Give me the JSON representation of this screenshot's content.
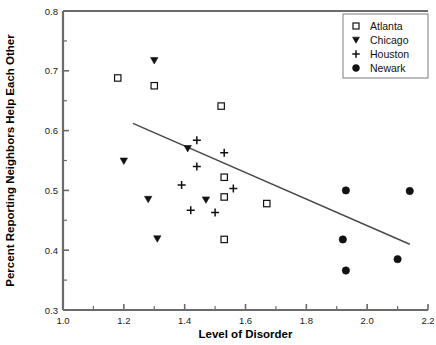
{
  "chart_data": {
    "type": "scatter",
    "title": "",
    "xlabel": "Level of Disorder",
    "ylabel": "Percent Reporting Neighbors Help Each Other",
    "xlim": [
      1.0,
      2.2
    ],
    "ylim": [
      0.3,
      0.8
    ],
    "xticks": [
      1.0,
      1.2,
      1.4,
      1.6,
      1.8,
      2.0,
      2.2
    ],
    "xtick_labels": [
      "1.0",
      "1.2",
      "1.4",
      "1.6",
      "1.8",
      "2.0",
      "2.2"
    ],
    "xtick_minor_step": 0.1,
    "yticks": [
      0.3,
      0.4,
      0.5,
      0.6,
      0.7,
      0.8
    ],
    "ytick_labels": [
      "0.3",
      "0.4",
      "0.5",
      "0.6",
      "0.7",
      "0.8"
    ],
    "ytick_minor_step": 0.05,
    "grid": false,
    "legend_position": "top-right",
    "series": [
      {
        "name": "Atlanta",
        "marker": "open-square",
        "points": [
          [
            1.18,
            0.688
          ],
          [
            1.3,
            0.675
          ],
          [
            1.52,
            0.641
          ],
          [
            1.53,
            0.522
          ],
          [
            1.53,
            0.489
          ],
          [
            1.67,
            0.478
          ],
          [
            1.53,
            0.418
          ]
        ]
      },
      {
        "name": "Chicago",
        "marker": "filled-triangle-down",
        "points": [
          [
            1.3,
            0.717
          ],
          [
            1.41,
            0.57
          ],
          [
            1.2,
            0.549
          ],
          [
            1.28,
            0.485
          ],
          [
            1.47,
            0.484
          ],
          [
            1.31,
            0.419
          ]
        ]
      },
      {
        "name": "Houston",
        "marker": "plus",
        "points": [
          [
            1.44,
            0.584
          ],
          [
            1.53,
            0.563
          ],
          [
            1.44,
            0.54
          ],
          [
            1.39,
            0.509
          ],
          [
            1.56,
            0.503
          ],
          [
            1.42,
            0.467
          ],
          [
            1.5,
            0.463
          ]
        ]
      },
      {
        "name": "Newark",
        "marker": "filled-circle",
        "points": [
          [
            1.93,
            0.5
          ],
          [
            2.14,
            0.499
          ],
          [
            1.92,
            0.418
          ],
          [
            2.1,
            0.385
          ],
          [
            1.93,
            0.366
          ]
        ]
      }
    ],
    "trend_line": {
      "name": "regression-line",
      "x_start": 1.23,
      "y_start": 0.612,
      "x_end": 2.14,
      "y_end": 0.41
    }
  },
  "legend": {
    "items": [
      {
        "label": "Atlanta",
        "marker": "open-square"
      },
      {
        "label": "Chicago",
        "marker": "filled-triangle-down"
      },
      {
        "label": "Houston",
        "marker": "plus"
      },
      {
        "label": "Newark",
        "marker": "filled-circle"
      }
    ]
  }
}
